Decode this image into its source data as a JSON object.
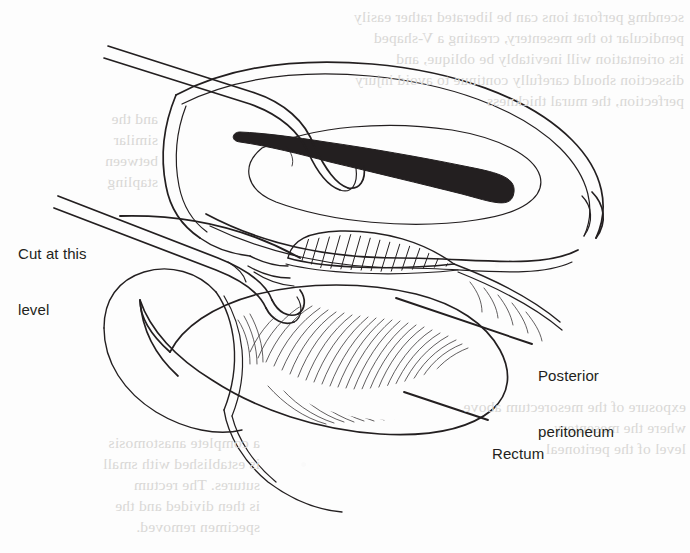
{
  "figure": {
    "type": "medical-line-illustration",
    "background_color": "#fdfdfd",
    "ink_color": "#231f20"
  },
  "labels": [
    {
      "id": "cut-level",
      "text": "Cut at this\nlevel",
      "line1": "Cut at this",
      "line2": "level",
      "align": "left",
      "leader": "from right of text, curving down-right to the peritoneal reflection"
    },
    {
      "id": "posterior-peritoneum",
      "text": "Posterior\nperitoneum",
      "line1": "Posterior",
      "line2": "peritoneum",
      "align": "left",
      "leader": "from upper-left, pointing up-left into the hatched peritoneal flap"
    },
    {
      "id": "rectum",
      "text": "Rectum",
      "line1": "Rectum",
      "align": "left",
      "leader": "from upper-left, pointing up-left onto the striated rectal wall"
    }
  ],
  "bleed_through": {
    "note": "faint mirror-reversed text from the reverse side of the page",
    "color": "#d9d8d6",
    "blocks": [
      {
        "id": "top-right",
        "text": "scendmg perforat ions can be liberated rather easily\npendicular to the mesentery, creating a V-shaped\nits orientation will inevitably be oblique, and\ndissection should carefully continue to avoid injury\nperfection, the mural thickness"
      },
      {
        "id": "left-upper",
        "text": "and the\nsimilar\nbetween\nstapling"
      },
      {
        "id": "right-lower",
        "text": "exposure of the mesorectum above\nwhere the mesentery\nlevel of the peritoneal"
      },
      {
        "id": "lower-left",
        "text": "a complete anastomosis\nis established with small\nsutures. The rectum\nis then divided and the\nspecimen removed."
      }
    ]
  }
}
